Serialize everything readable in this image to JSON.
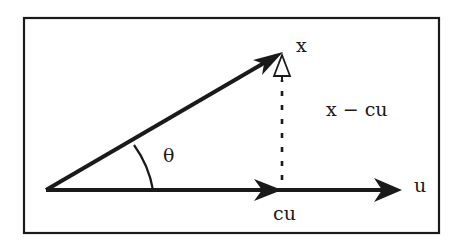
{
  "diagram": {
    "type": "vector-projection",
    "colors": {
      "background": "#ffffff",
      "ink": "#1a1a1a"
    },
    "labels": {
      "x": "x",
      "u": "u",
      "cu": "cu",
      "residual": "x − cu",
      "angle": "θ"
    },
    "vectors": [
      {
        "name": "x",
        "from": [
          46,
          190
        ],
        "to": [
          282,
          52
        ],
        "style": "solid-arrow"
      },
      {
        "name": "u",
        "from": [
          46,
          190
        ],
        "to": [
          400,
          190
        ],
        "style": "solid-arrow"
      },
      {
        "name": "cu",
        "from": [
          46,
          190
        ],
        "to": [
          282,
          190
        ],
        "style": "solid-arrow-on-u"
      },
      {
        "name": "x-cu",
        "from": [
          282,
          180
        ],
        "to": [
          282,
          54
        ],
        "style": "dotted-hollow-arrow"
      }
    ]
  }
}
